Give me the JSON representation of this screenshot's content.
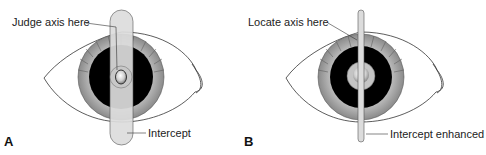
{
  "figure": {
    "panels": [
      {
        "id": "A",
        "letter": "A",
        "callout_top": "Judge axis here",
        "callout_bottom": "Intercept",
        "beam": "wide"
      },
      {
        "id": "B",
        "letter": "B",
        "callout_top": "Locate axis here",
        "callout_bottom": "Intercept enhanced",
        "beam": "narrow"
      }
    ]
  },
  "colors": {
    "outline": "#333333",
    "pupil": "#000000",
    "iris_gray": "#9a9a9a",
    "beam_fill": "#dcdcdc"
  }
}
